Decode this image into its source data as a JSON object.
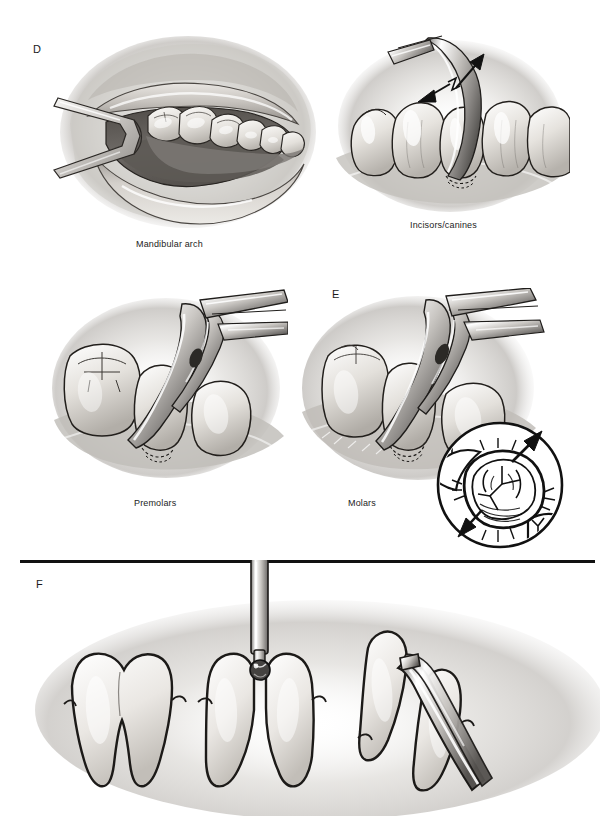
{
  "document": {
    "type": "medical-illustration-figure",
    "page_background": "#ffffff",
    "top_cropped_caption": "",
    "divider_color": "#111111"
  },
  "panels": [
    {
      "letter": "D",
      "subfigures": [
        {
          "id": "mandibular-arch",
          "caption": "Mandibular arch",
          "description": "Intraoral view of mandibular arch retracted with a cheek retractor exposing lower teeth"
        },
        {
          "id": "incisors-canines",
          "caption": "Incisors/canines",
          "description": "Curved elevator luxating an incisor/canine with two directional arrows"
        },
        {
          "id": "premolars",
          "caption": "Premolars",
          "description": "Extraction forceps applied to a premolar adjacent to a molar"
        }
      ]
    },
    {
      "letter": "E",
      "subfigures": [
        {
          "id": "molars",
          "caption": "Molars",
          "description": "Extraction forceps applied to a mandibular molar",
          "inset": {
            "id": "occlusal-inset",
            "description": "Circular occlusal-view inset of molar with buccal and lingual movement arrows",
            "arrows": [
              "up-right",
              "down-left"
            ]
          }
        }
      ]
    },
    {
      "letter": "F",
      "subfigures": [
        {
          "id": "intact-molar",
          "caption": "",
          "description": "Intact two-rooted mandibular molar"
        },
        {
          "id": "sectioned-molar",
          "caption": "",
          "description": "Molar sectioned between roots using a round bur on a handpiece"
        },
        {
          "id": "root-elevation",
          "caption": "",
          "description": "Sectioned root being elevated with a straight elevator"
        }
      ]
    }
  ],
  "labels": {
    "panel_d": "D",
    "panel_e": "E",
    "panel_f": "F",
    "mandibular_arch": "Mandibular arch",
    "incisors_canines": "Incisors/canines",
    "premolars": "Premolars",
    "molars": "Molars"
  },
  "palette": {
    "ink": "#111111",
    "tooth_light": "#f4f2ee",
    "tooth_mid": "#d8d4cd",
    "tooth_shadow": "#a9a49c",
    "tissue_mid": "#bdb9b4",
    "tissue_dark": "#6f6b67",
    "metal_light": "#ffffff",
    "metal_mid": "#c9c7c4",
    "metal_dark": "#6a6866",
    "vignette": "#9d9a96"
  }
}
